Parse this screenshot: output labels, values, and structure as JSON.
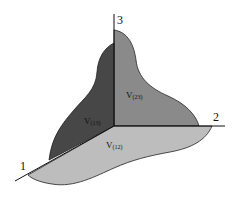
{
  "diagram": {
    "axes": [
      {
        "id": "1",
        "label": "1"
      },
      {
        "id": "2",
        "label": "2"
      },
      {
        "id": "3",
        "label": "3"
      }
    ],
    "panels": [
      {
        "id": "v13",
        "label_main": "V",
        "label_sub": "(13)",
        "color": "#474747"
      },
      {
        "id": "v23",
        "label_main": "V",
        "label_sub": "(23)",
        "color": "#8a8a8a"
      },
      {
        "id": "v12",
        "label_main": "V",
        "label_sub": "(12)",
        "color": "#bdbdbd"
      }
    ],
    "stroke_color": "#111111"
  }
}
